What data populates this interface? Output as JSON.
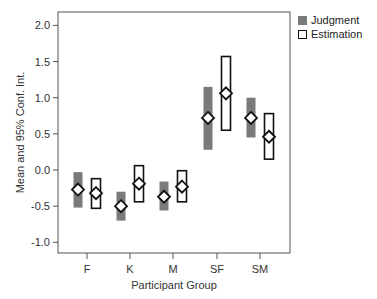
{
  "chart_data": {
    "type": "error-bar",
    "title": "",
    "xlabel": "Participant Group",
    "ylabel": "Mean and 95% Conf. Int.",
    "categories": [
      "F",
      "K",
      "M",
      "SF",
      "SM"
    ],
    "ylim": [
      -1.15,
      2.2
    ],
    "yticks": [
      -1.0,
      -0.5,
      0.0,
      0.5,
      1.0,
      1.5,
      2.0
    ],
    "ytick_labels": [
      "-1.0",
      "-0.5",
      "0.0",
      "0.5",
      "1.0",
      "1.5",
      "2.0"
    ],
    "grid": false,
    "legend_position": "top-right-outside",
    "series": [
      {
        "name": "Judgment",
        "style": "filled-gray",
        "color": "#7a7a7a",
        "means": [
          -0.27,
          -0.5,
          -0.37,
          0.72,
          0.72
        ],
        "lower": [
          -0.52,
          -0.7,
          -0.56,
          0.28,
          0.45
        ],
        "upper": [
          -0.03,
          -0.3,
          -0.16,
          1.15,
          1.0
        ]
      },
      {
        "name": "Estimation",
        "style": "open-black",
        "color": "#111111",
        "means": [
          -0.32,
          -0.19,
          -0.23,
          1.06,
          0.46
        ],
        "lower": [
          -0.53,
          -0.44,
          -0.44,
          0.55,
          0.15
        ],
        "upper": [
          -0.12,
          0.06,
          -0.01,
          1.57,
          0.78
        ]
      }
    ]
  },
  "legend": {
    "items": [
      {
        "label": "Judgment"
      },
      {
        "label": "Estimation"
      }
    ]
  }
}
